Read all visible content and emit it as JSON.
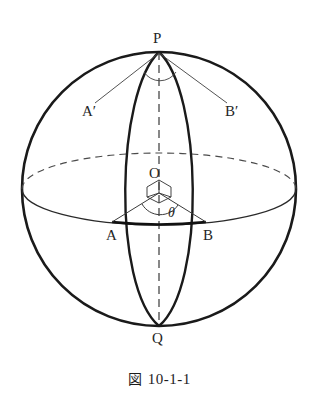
{
  "figure": {
    "caption_symbol": "図",
    "caption_number": "10-1-1",
    "type": "geometry-diagram"
  },
  "labels": {
    "north_pole": "P",
    "south_pole": "Q",
    "center": "O",
    "point_a": "A",
    "point_b": "B",
    "point_a_prime": "A′",
    "point_b_prime": "B′",
    "angle": "θ"
  },
  "colors": {
    "ink": "#1a1a1a",
    "thin_ink": "#3a3a3a",
    "dashed_ink": "#555555",
    "background": "#ffffff"
  },
  "geometry": {
    "sphere_center_x": 159,
    "sphere_center_y": 189,
    "sphere_radius": 137,
    "equator_semi_minor": 36,
    "lens_half_width": 47,
    "chord_y": 222,
    "point_a_x": 112,
    "point_b_x": 206
  }
}
